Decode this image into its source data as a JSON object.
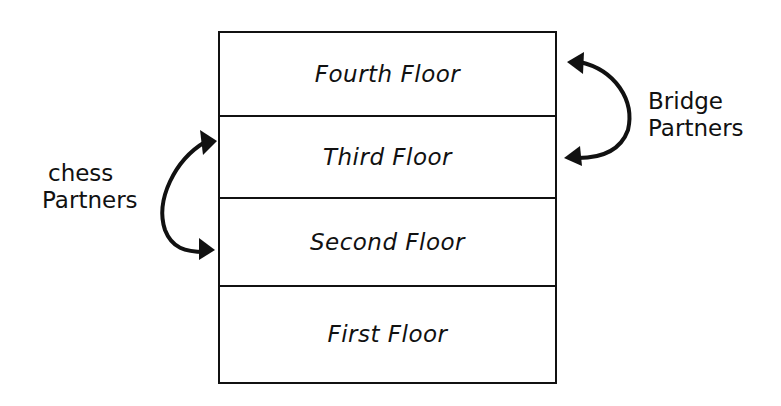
{
  "diagram": {
    "floors": [
      {
        "id": "fourth",
        "label": "Fourth Floor"
      },
      {
        "id": "third",
        "label": "Third Floor"
      },
      {
        "id": "second",
        "label": "Second Floor"
      },
      {
        "id": "first",
        "label": "First Floor"
      }
    ],
    "annotations": {
      "chess": {
        "line1": "chess",
        "line2": "Partners",
        "connects": [
          "Third Floor",
          "Second Floor"
        ]
      },
      "bridge": {
        "line1": "Bridge",
        "line2": "Partners",
        "connects": [
          "Fourth Floor",
          "Third Floor"
        ]
      }
    },
    "colors": {
      "ink": "#111111",
      "background": "#ffffff"
    }
  }
}
